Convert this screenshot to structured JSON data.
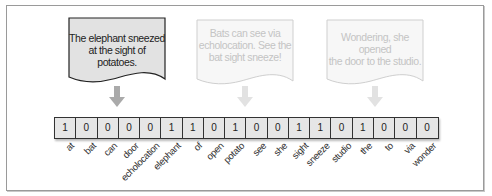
{
  "documents": [
    {
      "text_line1": "The elephant sneezed",
      "text_line2": "at the sight of potatoes.",
      "state": "active",
      "fill": "#e2e2e2",
      "stroke": "#222222",
      "text_color": "#222222"
    },
    {
      "text_line1": "Bats can see via",
      "text_line2": "echolocation. See the",
      "text_line3": "bat sight sneeze!",
      "state": "faded",
      "fill": "#f7f7f7",
      "stroke": "#cfcfcf",
      "text_color": "#c4c4c4"
    },
    {
      "text_line1": "Wondering, she opened",
      "text_line2": "the door to the studio.",
      "state": "faded",
      "fill": "#f7f7f7",
      "stroke": "#cfcfcf",
      "text_color": "#c4c4c4"
    }
  ],
  "vector": {
    "words": [
      "at",
      "bat",
      "can",
      "door",
      "echolocation",
      "elephant",
      "of",
      "open",
      "potato",
      "see",
      "she",
      "sight",
      "sneeze",
      "studio",
      "the",
      "to",
      "via",
      "wonder"
    ],
    "values": [
      "1",
      "0",
      "0",
      "0",
      "0",
      "1",
      "1",
      "0",
      "1",
      "0",
      "0",
      "1",
      "1",
      "0",
      "1",
      "0",
      "0",
      "0"
    ]
  },
  "colors": {
    "arrow_active": "#aaaaaa",
    "arrow_faded": "#e2e2e2",
    "cell_fill": "#e6e6e6",
    "cell_border": "#333333"
  }
}
